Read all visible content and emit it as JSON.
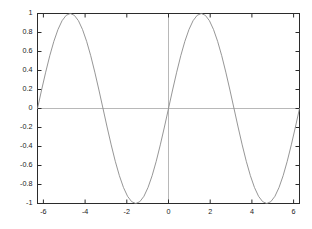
{
  "chart_data": {
    "type": "line",
    "title": "",
    "subtitle": "",
    "xlabel": "",
    "ylabel": "",
    "legend": [],
    "legend_position": "none",
    "grid": false,
    "xlim": [
      -6.283185,
      6.283185
    ],
    "ylim": [
      -1,
      1
    ],
    "xticks": [
      -6,
      -4,
      -2,
      0,
      2,
      4,
      6
    ],
    "xtick_labels": [
      "-6",
      "-4",
      "-2",
      "0",
      "2",
      "4",
      "6"
    ],
    "yticks": [
      -1,
      -0.8,
      -0.6,
      -0.4,
      -0.2,
      0,
      0.2,
      0.4,
      0.6,
      0.8,
      1
    ],
    "ytick_labels": [
      "-1",
      "-0.8",
      "-0.6",
      "-0.4",
      "-0.2",
      "0",
      "0.2",
      "0.4",
      "0.6",
      "0.8",
      "1"
    ],
    "axis_lines": {
      "x_zero": true,
      "y_zero": true
    },
    "series": [
      {
        "name": "sin(x)",
        "function": "sin(x)",
        "color": "#8a8a8a",
        "x": [
          -6.283185,
          -6.086836,
          -5.890486,
          -5.694137,
          -5.497787,
          -5.301438,
          -5.105088,
          -4.908739,
          -4.712389,
          -4.516039,
          -4.31969,
          -4.12334,
          -3.926991,
          -3.730641,
          -3.534292,
          -3.337942,
          -3.141593,
          -2.945243,
          -2.748894,
          -2.552544,
          -2.356194,
          -2.159845,
          -1.963495,
          -1.767146,
          -1.570796,
          -1.374447,
          -1.178097,
          -0.981748,
          -0.785398,
          -0.589049,
          -0.392699,
          -0.19635,
          0,
          0.19635,
          0.392699,
          0.589049,
          0.785398,
          0.981748,
          1.178097,
          1.374447,
          1.570796,
          1.767146,
          1.963495,
          2.159845,
          2.356194,
          2.552544,
          2.748894,
          2.945243,
          3.141593,
          3.337942,
          3.534292,
          3.730641,
          3.926991,
          4.12334,
          4.31969,
          4.516039,
          4.712389,
          4.908739,
          5.105088,
          5.301438,
          5.497787,
          5.694137,
          5.890486,
          6.086836,
          6.283185
        ],
        "values": [
          0,
          0.19509,
          0.382683,
          0.55557,
          0.707107,
          0.83147,
          0.92388,
          0.980785,
          1,
          0.980785,
          0.92388,
          0.83147,
          0.707107,
          0.55557,
          0.382683,
          0.19509,
          0,
          -0.19509,
          -0.382683,
          -0.55557,
          -0.707107,
          -0.83147,
          -0.92388,
          -0.980785,
          -1,
          -0.980785,
          -0.92388,
          -0.83147,
          -0.707107,
          -0.55557,
          -0.382683,
          -0.19509,
          0,
          0.19509,
          0.382683,
          0.55557,
          0.707107,
          0.83147,
          0.92388,
          0.980785,
          1,
          0.980785,
          0.92388,
          0.83147,
          0.707107,
          0.55557,
          0.382683,
          0.19509,
          0,
          -0.19509,
          -0.382683,
          -0.55557,
          -0.707107,
          -0.83147,
          -0.92388,
          -0.980785,
          -1,
          -0.980785,
          -0.92388,
          -0.83147,
          -0.707107,
          -0.55557,
          -0.382683,
          -0.19509,
          0
        ]
      }
    ],
    "colors": {
      "background": "#ffffff",
      "frame": "#2b2b2b",
      "curve": "#8a8a8a",
      "axis_line": "#b8b8b8",
      "tick_label": "#1a1a1a"
    }
  }
}
